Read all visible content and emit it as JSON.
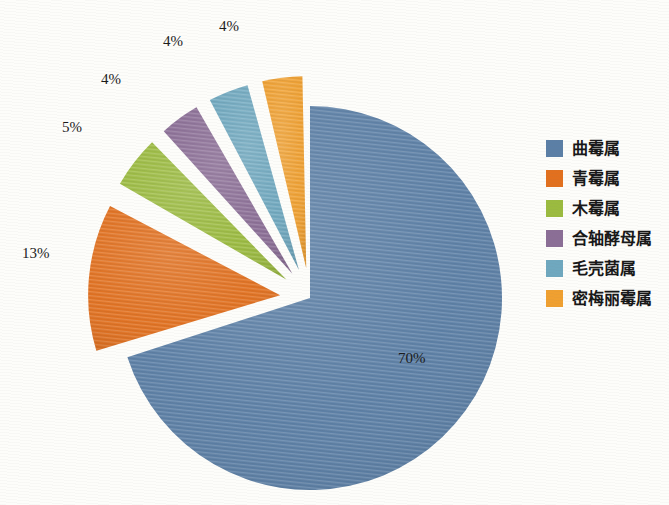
{
  "background_color": "#fdfdfa",
  "legend": {
    "position": "right",
    "items": [
      {
        "label": "曲霉属",
        "color": "#5b7fa6",
        "value": 70
      },
      {
        "label": "青霉属",
        "color": "#e2701e",
        "value": 13
      },
      {
        "label": "木霉属",
        "color": "#9bbb3f",
        "value": 5
      },
      {
        "label": "合轴酵母属",
        "color": "#8b6e96",
        "value": 4
      },
      {
        "label": "毛壳菌属",
        "color": "#6fa8bf",
        "value": 4
      },
      {
        "label": "密梅丽霉属",
        "color": "#f0a030",
        "value": 4
      }
    ]
  },
  "slice_labels": [
    {
      "text": "70%",
      "x": 398,
      "y": 350
    },
    {
      "text": "13%",
      "x": 22,
      "y": 245
    },
    {
      "text": "5%",
      "x": 62,
      "y": 119
    },
    {
      "text": "4%",
      "x": 101,
      "y": 71
    },
    {
      "text": "4%",
      "x": 163,
      "y": 33
    },
    {
      "text": "4%",
      "x": 219,
      "y": 18
    }
  ],
  "chart_data": {
    "type": "pie",
    "title": "",
    "subtitle": "",
    "xlabel": "",
    "ylabel": "",
    "unit": "%",
    "grid": false,
    "legend_position": "right",
    "exploded": true,
    "start_angle_deg": 0,
    "direction": "clockwise",
    "categories": [
      "曲霉属",
      "青霉属",
      "木霉属",
      "合轴酵母属",
      "毛壳菌属",
      "密梅丽霉属"
    ],
    "values": [
      70,
      13,
      5,
      4,
      4,
      4
    ],
    "data_labels": [
      "70%",
      "13%",
      "5%",
      "4%",
      "4%",
      "4%"
    ],
    "colors": [
      "#5b7fa6",
      "#e2701e",
      "#9bbb3f",
      "#8b6e96",
      "#6fa8bf",
      "#f0a030"
    ],
    "slices": [
      {
        "name": "曲霉属",
        "value": 70,
        "label": "70%",
        "color": "#5b7fa6",
        "exploded": false
      },
      {
        "name": "青霉属",
        "value": 13,
        "label": "13%",
        "color": "#e2701e",
        "exploded": true
      },
      {
        "name": "木霉属",
        "value": 5,
        "label": "5%",
        "color": "#9bbb3f",
        "exploded": true
      },
      {
        "name": "合轴酵母属",
        "value": 4,
        "label": "4%",
        "color": "#8b6e96",
        "exploded": true
      },
      {
        "name": "毛壳菌属",
        "value": 4,
        "label": "4%",
        "color": "#6fa8bf",
        "exploded": true
      },
      {
        "name": "密梅丽霉属",
        "value": 4,
        "label": "4%",
        "color": "#f0a030",
        "exploded": true
      }
    ],
    "geometry": {
      "center_x": 310,
      "center_y": 298,
      "radius": 192,
      "explode_offset": 30
    }
  }
}
